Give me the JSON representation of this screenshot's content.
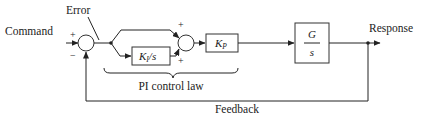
{
  "diagram": {
    "labels": {
      "command": "Command",
      "error": "Error",
      "response": "Response",
      "feedback": "Feedback",
      "pi_control_law": "PI control law"
    },
    "summing_junction_1": {
      "plus": "+",
      "minus": "−"
    },
    "summing_junction_2": {
      "plus_top": "+",
      "plus_bottom": "+"
    },
    "blocks": {
      "integral": {
        "num": "K",
        "sub": "I",
        "den": "/s"
      },
      "proportional": {
        "sym": "K",
        "sub": "P"
      },
      "plant": {
        "numerator": "G",
        "denominator": "s"
      }
    },
    "colors": {
      "line": "#222222",
      "background": "#ffffff"
    }
  }
}
